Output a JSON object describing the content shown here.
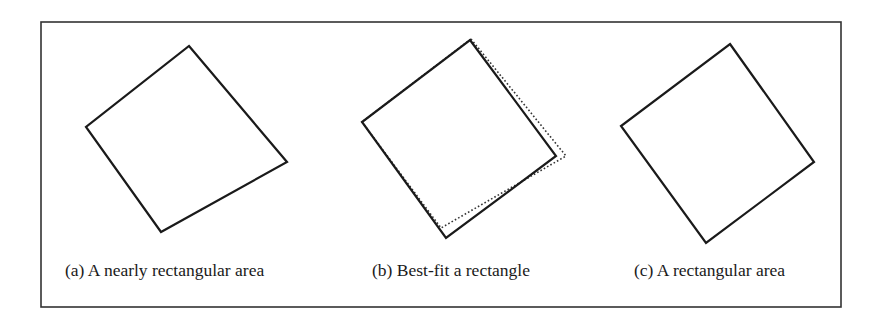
{
  "figure": {
    "panels": [
      {
        "id": "a",
        "caption": "(a) A nearly rectangular area",
        "description": "Irregular quadrilateral, nearly rectangular",
        "outlines": [
          {
            "style": "solid",
            "role": "nearly-rectangular-area"
          }
        ]
      },
      {
        "id": "b",
        "caption": "(b) Best-fit a rectangle",
        "description": "Original quadrilateral (solid) with best-fit rectangle overlaid (dotted)",
        "outlines": [
          {
            "style": "solid",
            "role": "original-area"
          },
          {
            "style": "dotted",
            "role": "best-fit-rectangle"
          }
        ]
      },
      {
        "id": "c",
        "caption": "(c) A rectangular area",
        "description": "Resulting rectangular area",
        "outlines": [
          {
            "style": "solid",
            "role": "rectangular-area"
          }
        ]
      }
    ],
    "colors": {
      "line": "#1a1a1a",
      "frame": "#333333",
      "background": "#ffffff"
    }
  }
}
